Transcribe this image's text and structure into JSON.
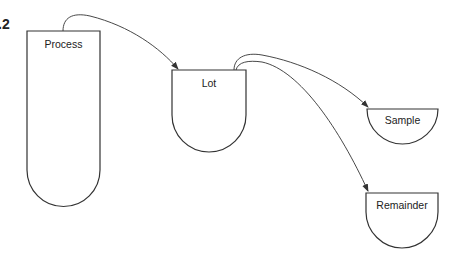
{
  "figure": {
    "label": ".2"
  },
  "nodes": {
    "process": {
      "label": "Process"
    },
    "lot": {
      "label": "Lot"
    },
    "sample": {
      "label": "Sample"
    },
    "remainder": {
      "label": "Remainder"
    }
  },
  "edges": [
    {
      "from": "Process",
      "to": "Lot"
    },
    {
      "from": "Lot",
      "to": "Sample"
    },
    {
      "from": "Lot",
      "to": "Remainder"
    }
  ],
  "colors": {
    "stroke": "#333333",
    "background": "#ffffff"
  }
}
